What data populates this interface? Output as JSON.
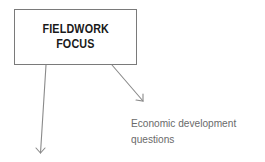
{
  "diagram": {
    "central_node": {
      "lines": [
        "FIELDWORK",
        "FOCUS"
      ],
      "border_color": "#7a7a7a",
      "text_color": "#1a1a1a"
    },
    "branches": [
      {
        "id": "economic-development",
        "label_lines": [
          "Economic development",
          "questions"
        ],
        "direction": "down-right"
      },
      {
        "id": "unlabeled-branch",
        "label_lines": [],
        "direction": "down"
      }
    ],
    "arrow_color": "#8a8a8a",
    "label_color": "#6a6a6a"
  }
}
